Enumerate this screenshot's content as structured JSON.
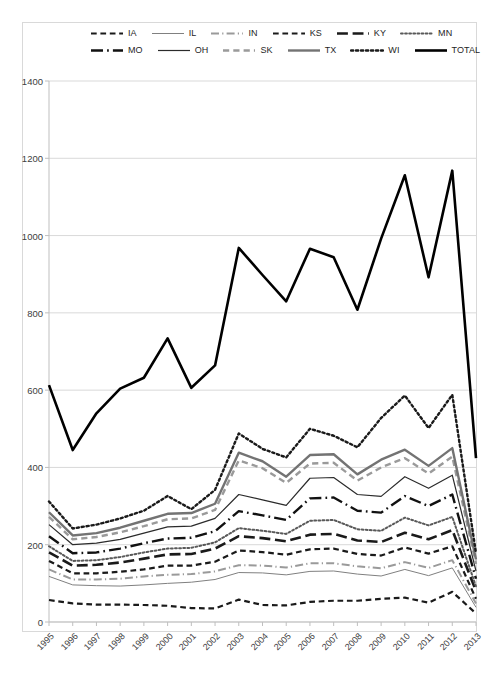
{
  "chart_data": {
    "type": "line",
    "title": "",
    "xlabel": "",
    "ylabel": "",
    "x": [
      1995,
      1996,
      1997,
      1998,
      1999,
      2000,
      2001,
      2002,
      2003,
      2004,
      2005,
      2006,
      2007,
      2008,
      2009,
      2010,
      2011,
      2012,
      2013
    ],
    "xlim": [
      1995,
      2013
    ],
    "ylim": [
      0,
      1400
    ],
    "yticks": [
      0,
      200,
      400,
      600,
      800,
      1000,
      1200,
      1400
    ],
    "grid": true,
    "legend_position": "top",
    "series": [
      {
        "name": "IA",
        "style": "dashed",
        "color": "#1a1a1a",
        "width": 2.2,
        "values": [
          57,
          48,
          45,
          45,
          44,
          42,
          36,
          35,
          58,
          44,
          43,
          52,
          55,
          55,
          60,
          63,
          50,
          78,
          22
        ]
      },
      {
        "name": "IL",
        "style": "solid",
        "color": "#808080",
        "width": 1.0,
        "values": [
          118,
          96,
          94,
          93,
          96,
          100,
          103,
          110,
          128,
          127,
          122,
          131,
          132,
          124,
          119,
          136,
          120,
          140,
          38
        ]
      },
      {
        "name": "IN",
        "style": "dashdot",
        "color": "#9a9a9a",
        "width": 2.0,
        "values": [
          136,
          110,
          110,
          112,
          118,
          122,
          124,
          131,
          147,
          146,
          141,
          152,
          152,
          144,
          139,
          155,
          140,
          160,
          48
        ]
      },
      {
        "name": "KS",
        "style": "dashed",
        "color": "#1a1a1a",
        "width": 2.2,
        "values": [
          158,
          126,
          126,
          130,
          136,
          146,
          146,
          156,
          185,
          181,
          174,
          188,
          190,
          176,
          172,
          193,
          177,
          196,
          60
        ]
      },
      {
        "name": "KY",
        "style": "longdash",
        "color": "#1a1a1a",
        "width": 2.6,
        "values": [
          180,
          146,
          148,
          154,
          164,
          175,
          176,
          190,
          222,
          217,
          209,
          226,
          228,
          211,
          207,
          231,
          214,
          238,
          80
        ]
      },
      {
        "name": "MN",
        "style": "dotted",
        "color": "#595959",
        "width": 2.0,
        "values": [
          196,
          158,
          160,
          168,
          180,
          190,
          192,
          206,
          243,
          236,
          228,
          262,
          264,
          240,
          236,
          270,
          250,
          272,
          92
        ]
      },
      {
        "name": "MO",
        "style": "dashdotlong",
        "color": "#111111",
        "width": 2.4,
        "values": [
          222,
          178,
          180,
          190,
          204,
          216,
          218,
          235,
          287,
          276,
          264,
          320,
          322,
          288,
          283,
          326,
          300,
          330,
          112
        ]
      },
      {
        "name": "OH",
        "style": "solid",
        "color": "#2b2b2b",
        "width": 1.2,
        "values": [
          252,
          200,
          204,
          214,
          230,
          246,
          248,
          268,
          330,
          316,
          302,
          372,
          374,
          330,
          325,
          376,
          346,
          380,
          132
        ]
      },
      {
        "name": "SK",
        "style": "dashed",
        "color": "#9a9a9a",
        "width": 2.4,
        "values": [
          272,
          214,
          220,
          232,
          248,
          266,
          268,
          290,
          418,
          398,
          360,
          410,
          412,
          366,
          400,
          424,
          384,
          428,
          150
        ]
      },
      {
        "name": "TX",
        "style": "solid",
        "color": "#737373",
        "width": 2.4,
        "values": [
          284,
          224,
          230,
          244,
          262,
          280,
          282,
          306,
          438,
          416,
          376,
          432,
          434,
          382,
          420,
          446,
          404,
          450,
          162
        ]
      },
      {
        "name": "WI",
        "style": "dotted",
        "color": "#1a1a1a",
        "width": 2.4,
        "values": [
          312,
          242,
          252,
          268,
          288,
          326,
          292,
          342,
          488,
          448,
          426,
          500,
          482,
          452,
          528,
          586,
          502,
          588,
          178
        ]
      },
      {
        "name": "TOTAL",
        "style": "solid",
        "color": "#000000",
        "width": 2.6,
        "values": [
          613,
          445,
          540,
          604,
          632,
          734,
          606,
          664,
          968,
          898,
          830,
          966,
          944,
          808,
          992,
          1156,
          892,
          1168,
          424
        ]
      }
    ]
  },
  "legend": {
    "rows": [
      [
        "IA",
        "IL",
        "IN",
        "KS",
        "KY",
        "MN"
      ],
      [
        "MO",
        "OH",
        "SK",
        "TX",
        "WI",
        "TOTAL"
      ]
    ]
  },
  "axes": {
    "y_tick_labels": [
      "1400",
      "1200",
      "1000",
      "800",
      "600",
      "400",
      "200",
      "0"
    ],
    "x_tick_labels": [
      "1995",
      "1996",
      "1997",
      "1998",
      "1999",
      "2000",
      "2001",
      "2002",
      "2003",
      "2004",
      "2005",
      "2006",
      "2007",
      "2008",
      "2009",
      "2010",
      "2011",
      "2012",
      "2013"
    ]
  }
}
